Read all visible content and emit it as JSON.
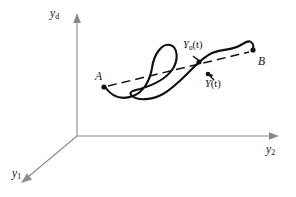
{
  "figure": {
    "title": "",
    "background_color": "#ffffff",
    "width": 296,
    "height": 197
  },
  "axes": {
    "origin": {
      "x": 77,
      "y": 136
    },
    "color": "#8a8a8a",
    "items": [
      {
        "id": "vertical",
        "label_base": "y",
        "label_sub": "d",
        "direction": "up",
        "tip": {
          "x": 77,
          "y": 16
        }
      },
      {
        "id": "horizontal",
        "label_base": "y",
        "label_sub": "2",
        "direction": "right",
        "tip": {
          "x": 278,
          "y": 136
        }
      },
      {
        "id": "depth",
        "label_base": "y",
        "label_sub": "1",
        "direction": "down-left",
        "tip": {
          "x": 22,
          "y": 182
        }
      }
    ]
  },
  "trajectories": {
    "nominal": {
      "id": "nominal-path",
      "style": "dashed",
      "color": "#101010",
      "from_label": "A",
      "to_label": "B",
      "start_point": {
        "x": 104,
        "y": 87
      },
      "end_point": {
        "x": 253,
        "y": 50
      }
    },
    "actual": {
      "id": "actual-path",
      "style": "solid",
      "color": "#101010",
      "has_loop": true,
      "start_point": {
        "x": 104,
        "y": 87
      },
      "end_point": {
        "x": 253,
        "y": 50
      }
    }
  },
  "markers": [
    {
      "id": "point-A",
      "label_base": "A",
      "label_sub": "",
      "has_paren_t": false,
      "point": {
        "x": 104,
        "y": 87
      },
      "dot": true
    },
    {
      "id": "point-B",
      "label_base": "B",
      "label_sub": "",
      "has_paren_t": false,
      "point": {
        "x": 253,
        "y": 50
      },
      "dot": true
    },
    {
      "id": "point-Y0t",
      "label_base": "Y",
      "label_sub": "0",
      "has_paren_t": true,
      "point": {
        "x": 199,
        "y": 62
      },
      "dot": true
    },
    {
      "id": "point-Yt",
      "label_base": "Y",
      "label_sub": "",
      "has_paren_t": true,
      "point": {
        "x": 208,
        "y": 74
      },
      "dot": true
    }
  ],
  "labels": {
    "y_d": {
      "base": "y",
      "sub": "d"
    },
    "y_2": {
      "base": "y",
      "sub": "2"
    },
    "y_1": {
      "base": "y",
      "sub": "1"
    },
    "A": {
      "base": "A"
    },
    "B": {
      "base": "B"
    },
    "Y0t": {
      "base": "Y",
      "sub": "0",
      "arg": "(t)"
    },
    "Yt": {
      "base": "Y",
      "sub": "",
      "arg": "(t)"
    }
  }
}
